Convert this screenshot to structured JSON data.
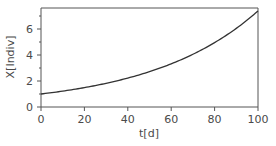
{
  "chart_data": {
    "type": "line",
    "title": "",
    "xlabel": "t[d]",
    "ylabel": "X[Indiv]",
    "xlim": [
      0,
      100
    ],
    "ylim": [
      0,
      7.6
    ],
    "xticks": [
      0,
      20,
      40,
      60,
      80,
      100
    ],
    "yticks": [
      0,
      2,
      4,
      6
    ],
    "yminor_ticks": [
      1,
      3,
      5,
      7
    ],
    "grid": false,
    "legend": null,
    "series": [
      {
        "name": "X(t)",
        "color": "#333333",
        "x": [
          0,
          10,
          20,
          30,
          40,
          50,
          60,
          70,
          80,
          90,
          100
        ],
        "y": [
          1.0,
          1.22,
          1.49,
          1.82,
          2.23,
          2.72,
          3.32,
          4.06,
          4.95,
          6.05,
          7.39
        ]
      }
    ]
  },
  "frame": {
    "color": "#555555"
  }
}
